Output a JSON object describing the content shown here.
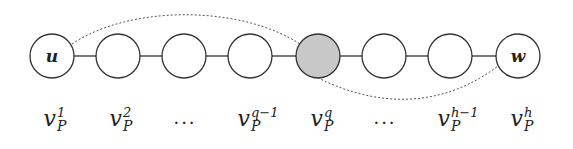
{
  "diagram": {
    "type": "path-graph",
    "colors": {
      "stroke": "#333333",
      "node_fill": "#ffffff",
      "highlight_fill": "#c8c8c8",
      "dotted_arc": "#555555"
    },
    "nodes": [
      {
        "id": "v1",
        "inner_label": "u",
        "highlighted": false
      },
      {
        "id": "v2",
        "inner_label": "",
        "highlighted": false
      },
      {
        "id": "v3",
        "inner_label": "",
        "highlighted": false
      },
      {
        "id": "v4",
        "inner_label": "",
        "highlighted": false
      },
      {
        "id": "vq",
        "inner_label": "",
        "highlighted": true
      },
      {
        "id": "v6",
        "inner_label": "",
        "highlighted": false
      },
      {
        "id": "v7",
        "inner_label": "",
        "highlighted": false
      },
      {
        "id": "v8",
        "inner_label": "w",
        "highlighted": false
      }
    ],
    "dotted_arcs": [
      {
        "from": "u",
        "to": "v_P^q",
        "side": "above"
      },
      {
        "from": "v_P^q",
        "to": "w",
        "side": "below"
      }
    ],
    "labels": [
      {
        "base": "v",
        "sup": "1",
        "sub": "P"
      },
      {
        "base": "v",
        "sup": "2",
        "sub": "P"
      },
      {
        "ellipsis": "···"
      },
      {
        "base": "v",
        "sup": "q−1",
        "sub": "P"
      },
      {
        "base": "v",
        "sup": "q",
        "sub": "P"
      },
      {
        "ellipsis": "···"
      },
      {
        "base": "v",
        "sup": "h−1",
        "sub": "P"
      },
      {
        "base": "v",
        "sup": "h",
        "sub": "P"
      }
    ]
  }
}
